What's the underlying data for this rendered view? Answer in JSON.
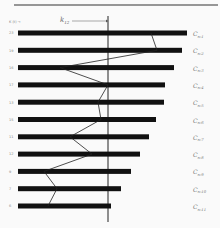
{
  "figure": {
    "header_label": "K (t) →",
    "threshold_label": "k",
    "threshold_subscript": "12",
    "rows": [
      {
        "left": "23",
        "label": "C",
        "sub": "n-1",
        "bar_end": 187,
        "vertex_x": 151
      },
      {
        "left": "19",
        "label": "C",
        "sub": "n-2",
        "bar_end": 182,
        "vertex_x": 157
      },
      {
        "left": "16",
        "label": "C",
        "sub": "n-3",
        "bar_end": 174,
        "vertex_x": 60
      },
      {
        "left": "17",
        "label": "C",
        "sub": "n-4",
        "bar_end": 165,
        "vertex_x": 108
      },
      {
        "left": "13",
        "label": "C",
        "sub": "n-5",
        "bar_end": 164,
        "vertex_x": 98
      },
      {
        "left": "15",
        "label": "C",
        "sub": "n-6",
        "bar_end": 156,
        "vertex_x": 101
      },
      {
        "left": "11",
        "label": "C",
        "sub": "n-7",
        "bar_end": 149,
        "vertex_x": 70
      },
      {
        "left": "12",
        "label": "C",
        "sub": "n-8",
        "bar_end": 140,
        "vertex_x": 92
      },
      {
        "left": "9",
        "label": "C",
        "sub": "n-9",
        "bar_end": 131,
        "vertex_x": 44
      },
      {
        "left": "7",
        "label": "C",
        "sub": "n-10",
        "bar_end": 121,
        "vertex_x": 57
      },
      {
        "left": "6",
        "label": "C",
        "sub": "n-11",
        "bar_end": 111,
        "vertex_x": 48
      }
    ],
    "threshold_x": 108,
    "colors": {
      "bar": "#111111",
      "line": "#222222",
      "background": "#fafafa"
    }
  }
}
